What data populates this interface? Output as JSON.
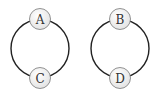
{
  "diagram": {
    "type": "graph",
    "components": [
      {
        "nodes": [
          {
            "id": "A",
            "label": "A",
            "cx": 40,
            "cy": 19
          },
          {
            "id": "C",
            "label": "C",
            "cx": 40,
            "cy": 78
          }
        ],
        "edges": [
          {
            "from": "A",
            "to": "C",
            "side": "left"
          },
          {
            "from": "A",
            "to": "C",
            "side": "right"
          }
        ]
      },
      {
        "nodes": [
          {
            "id": "B",
            "label": "B",
            "cx": 120,
            "cy": 19
          },
          {
            "id": "D",
            "label": "D",
            "cx": 120,
            "cy": 78
          }
        ],
        "edges": [
          {
            "from": "B",
            "to": "D",
            "side": "left"
          },
          {
            "from": "B",
            "to": "D",
            "side": "right"
          }
        ]
      }
    ],
    "colors": {
      "edge": "#222222",
      "node_stroke": "#666666",
      "node_fill": "#f4f4f4"
    }
  }
}
